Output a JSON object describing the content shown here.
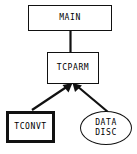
{
  "diagram": {
    "background_color": "#ffffff",
    "stroke_color": "#111111",
    "text_color": "#000000",
    "nodes": [
      {
        "id": "main",
        "label": "MAIN",
        "shape": "rectangle",
        "border": "thin",
        "x": 28,
        "y": 5,
        "width": 84,
        "height": 26
      },
      {
        "id": "tcparm",
        "label": "TCPARM",
        "shape": "rectangle",
        "border": "thin",
        "x": 47,
        "y": 52,
        "width": 52,
        "height": 32
      },
      {
        "id": "tconvt",
        "label": "TCONVT",
        "shape": "rectangle",
        "border": "thick",
        "x": 6,
        "y": 111,
        "width": 49,
        "height": 32
      },
      {
        "id": "datadisc",
        "label_line1": "DATA",
        "label_line2": "DISC",
        "shape": "stadium",
        "border": "thin",
        "x": 80,
        "y": 111,
        "width": 52,
        "height": 34
      }
    ],
    "edges": [
      {
        "id": "main-to-tcparm",
        "from": "main",
        "to": "tcparm",
        "arrowhead": "none",
        "style": "solid"
      },
      {
        "id": "tconvt-to-tcparm",
        "from": "tconvt",
        "to": "tcparm",
        "arrowhead": "filled-triangle",
        "style": "solid"
      },
      {
        "id": "datadisc-to-tcparm",
        "from": "datadisc",
        "to": "tcparm",
        "arrowhead": "filled-triangle",
        "style": "solid"
      }
    ]
  }
}
